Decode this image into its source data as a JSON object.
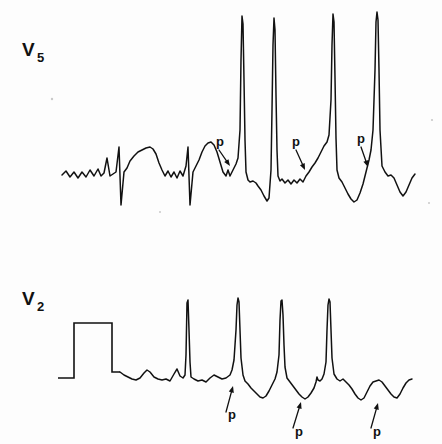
{
  "figure": {
    "kind": "ecg-rhythm-strip",
    "background_color": "#fdfdfd",
    "trace_color": "#111111",
    "width": 442,
    "height": 444
  },
  "chart_data": {
    "type": "line",
    "title": "",
    "xlabel": "",
    "ylabel": "",
    "grid": false,
    "legend": null,
    "axis_ranges": {
      "x": [
        0,
        442
      ],
      "y": [
        0,
        444
      ]
    },
    "series": [
      {
        "name": "V5",
        "baseline_y": 173,
        "points": "62,175 66,171 70,177 74,172 78,178 82,172 86,177 90,170 94,176 98,169 101,176 104,173 107,158 110,176 113,174 116,172 119,147 121,205 124,172 127,168 130,161 134,156 138,152 142,150 146,148 150,147 153,149 156,154 159,163 162,170 165,176 168,171 171,177 174,172 177,178 180,171 183,176 186,166 188,147 190,205 193,172 196,166 199,160 202,152 205,146 208,143 211,142 214,145 217,152 220,162 223,172 226,176 228,170 230,176 232,172 234,168 236,164 238,158 240,130 241,60 242,16 243,24 244,80 245,140 246,172 248,180 250,182 253,181 256,183 258,186 261,190 264,196 267,201 269,198 271,170 272,110 273,45 274,18 275,30 276,95 277,150 278,176 280,181 282,179 285,183 288,180 291,184 294,180 297,183 300,179 303,182 306,176 309,172 312,167 315,163 318,158 321,152 324,146 327,142 329,135 331,100 332,45 333,14 334,22 335,78 336,138 337,170 339,178 342,182 345,188 348,194 351,199 354,202 357,200 360,193 363,184 366,172 369,160 371,150 373,130 375,70 376,22 377,12 378,20 379,70 380,130 382,166 385,172 388,176 391,175 394,178 397,185 400,192 403,196 406,192 409,185 412,178 415,174"
      },
      {
        "name": "V2",
        "baseline_y": 378,
        "calibration_pulse": "58,378 74,378 74,323 112,323 112,372 120,372",
        "points": "120,372 124,375 128,377 132,379 136,380 140,378 144,373 147,370 150,372 154,377 158,379 162,380 166,379 170,381 174,374 177,369 180,376 183,378 185,375 186,355 187,303 188,300 189,330 190,362 191,377 194,379 198,381 202,380 206,382 210,378 214,375 218,377 222,379 226,378 230,375 232,370 234,360 236,330 237,305 238,298 239,302 240,330 241,358 243,375 245,381 248,384 251,388 254,391 257,394 260,397 263,398 266,396 269,391 272,385 275,379 277,372 279,355 280,320 281,301 282,300 283,315 284,345 285,367 287,378 290,382 293,386 296,390 299,394 302,397 305,399 308,397 311,393 314,388 316,382 317,377 318,380 320,381 322,379 324,374 326,362 327,330 328,305 329,299 330,302 331,330 332,358 334,374 337,379 340,381 343,379 346,382 349,385 352,389 355,394 358,398 361,400 364,398 367,392 370,386 373,382 376,381 379,380 382,382 385,386 388,390 391,394 394,397 397,398 400,394 403,388 406,383 409,380 412,379"
      }
    ]
  },
  "labels": {
    "lead_top": {
      "text": "V",
      "subscript": "5",
      "x": 22,
      "y": 56
    },
    "lead_bottom": {
      "text": "V",
      "subscript": "2",
      "x": 22,
      "y": 305
    }
  },
  "p_wave_annotations": [
    {
      "id": "v5-p1",
      "label": "p",
      "lead": "V5",
      "label_x": 216,
      "label_y": 146,
      "arrow_from_x": 219,
      "arrow_from_y": 150,
      "arrow_to_x": 230,
      "arrow_to_y": 166
    },
    {
      "id": "v5-p2",
      "label": "p",
      "lead": "V5",
      "label_x": 292,
      "label_y": 146,
      "arrow_from_x": 296,
      "arrow_from_y": 150,
      "arrow_to_x": 305,
      "arrow_to_y": 170
    },
    {
      "id": "v5-p3",
      "label": "p",
      "lead": "V5",
      "label_x": 357,
      "label_y": 143,
      "arrow_from_x": 361,
      "arrow_from_y": 147,
      "arrow_to_x": 368,
      "arrow_to_y": 167
    },
    {
      "id": "v2-p1",
      "label": "p",
      "lead": "V2",
      "label_x": 228,
      "label_y": 419,
      "arrow_from_x": 226,
      "arrow_from_y": 412,
      "arrow_to_x": 233,
      "arrow_to_y": 386
    },
    {
      "id": "v2-p2",
      "label": "p",
      "lead": "V2",
      "label_x": 295,
      "label_y": 436,
      "arrow_from_x": 293,
      "arrow_from_y": 428,
      "arrow_to_x": 301,
      "arrow_to_y": 402
    },
    {
      "id": "v2-p3",
      "label": "p",
      "lead": "V2",
      "label_x": 373,
      "label_y": 436,
      "arrow_from_x": 371,
      "arrow_from_y": 428,
      "arrow_to_x": 378,
      "arrow_to_y": 403
    }
  ],
  "specks": [
    {
      "x": 52,
      "y": 99,
      "r": 1.2
    },
    {
      "x": 432,
      "y": 120,
      "r": 1.1
    },
    {
      "x": 429,
      "y": 203,
      "r": 1.0
    },
    {
      "x": 160,
      "y": 212,
      "r": 1.0
    }
  ]
}
